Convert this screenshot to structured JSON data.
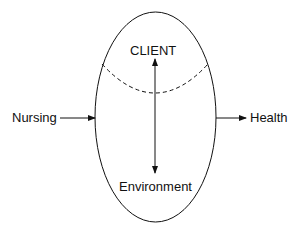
{
  "diagram": {
    "nodes": {
      "client": "CLIENT",
      "environment": "Environment",
      "nursing": "Nursing",
      "health": "Health"
    },
    "edges": [
      {
        "from": "Nursing",
        "to": "ellipse",
        "type": "arrow"
      },
      {
        "from": "ellipse",
        "to": "Health",
        "type": "arrow"
      },
      {
        "from": "CLIENT",
        "to": "Environment",
        "type": "double-arrow"
      }
    ],
    "colors": {
      "stroke": "#111111",
      "background": "#ffffff"
    }
  }
}
